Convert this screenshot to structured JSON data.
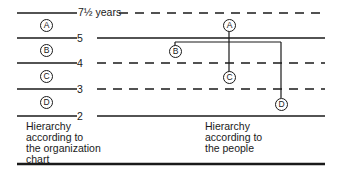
{
  "diagram": {
    "levels": [
      {
        "label": "7½ years",
        "style": "dashed-right"
      },
      {
        "label": "5",
        "style": "solid"
      },
      {
        "label": "4",
        "style": "dashed-right"
      },
      {
        "label": "3",
        "style": "dashed-right"
      },
      {
        "label": "2",
        "style": "solid"
      }
    ],
    "org_chart_nodes": [
      "A",
      "B",
      "C",
      "D"
    ],
    "people_nodes": {
      "A": "A",
      "B": "B",
      "C": "C",
      "D": "D"
    },
    "captions": {
      "left": [
        "Hierarchy",
        "according to",
        "the organization",
        "chart"
      ],
      "right": [
        "Hierarchy",
        "according to",
        "the people"
      ]
    }
  }
}
